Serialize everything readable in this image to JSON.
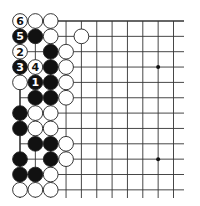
{
  "diagram": {
    "type": "go-board-fragment",
    "grid": {
      "origin_x": 20,
      "origin_y": 21,
      "spacing": 15.35,
      "columns": 11,
      "rows": 12,
      "line_extend_right": 184,
      "line_extend_bottom": 198,
      "line_color": "#333333",
      "top_edge": true,
      "left_edge": true
    },
    "star_points": [
      {
        "col": 9,
        "row": 3
      },
      {
        "col": 9,
        "row": 9
      }
    ],
    "stones": [
      {
        "col": 0,
        "row": 0,
        "color": "white",
        "label": "6"
      },
      {
        "col": 1,
        "row": 0,
        "color": "white"
      },
      {
        "col": 2,
        "row": 0,
        "color": "white"
      },
      {
        "col": 0,
        "row": 1,
        "color": "black",
        "label": "5"
      },
      {
        "col": 1,
        "row": 1,
        "color": "black"
      },
      {
        "col": 2,
        "row": 1,
        "color": "white"
      },
      {
        "col": 4,
        "row": 1,
        "color": "white"
      },
      {
        "col": 0,
        "row": 2,
        "color": "white",
        "label": "2"
      },
      {
        "col": 2,
        "row": 2,
        "color": "black"
      },
      {
        "col": 3,
        "row": 2,
        "color": "white"
      },
      {
        "col": 0,
        "row": 3,
        "color": "black",
        "label": "3"
      },
      {
        "col": 1,
        "row": 3,
        "color": "white",
        "label": "4"
      },
      {
        "col": 2,
        "row": 3,
        "color": "black"
      },
      {
        "col": 3,
        "row": 3,
        "color": "white"
      },
      {
        "col": 0,
        "row": 4,
        "color": "white"
      },
      {
        "col": 1,
        "row": 4,
        "color": "black",
        "label": "1"
      },
      {
        "col": 2,
        "row": 4,
        "color": "black"
      },
      {
        "col": 3,
        "row": 4,
        "color": "white"
      },
      {
        "col": 1,
        "row": 5,
        "color": "black"
      },
      {
        "col": 2,
        "row": 5,
        "color": "black"
      },
      {
        "col": 3,
        "row": 5,
        "color": "white"
      },
      {
        "col": 0,
        "row": 6,
        "color": "black"
      },
      {
        "col": 1,
        "row": 6,
        "color": "white"
      },
      {
        "col": 2,
        "row": 6,
        "color": "white"
      },
      {
        "col": 0,
        "row": 7,
        "color": "black"
      },
      {
        "col": 1,
        "row": 7,
        "color": "white"
      },
      {
        "col": 2,
        "row": 7,
        "color": "white"
      },
      {
        "col": 1,
        "row": 8,
        "color": "black"
      },
      {
        "col": 2,
        "row": 8,
        "color": "black"
      },
      {
        "col": 3,
        "row": 8,
        "color": "white"
      },
      {
        "col": 0,
        "row": 9,
        "color": "black"
      },
      {
        "col": 2,
        "row": 9,
        "color": "black"
      },
      {
        "col": 3,
        "row": 9,
        "color": "white"
      },
      {
        "col": 0,
        "row": 10,
        "color": "black"
      },
      {
        "col": 1,
        "row": 10,
        "color": "black"
      },
      {
        "col": 2,
        "row": 10,
        "color": "white"
      },
      {
        "col": 0,
        "row": 11,
        "color": "white"
      },
      {
        "col": 1,
        "row": 11,
        "color": "white"
      },
      {
        "col": 2,
        "row": 11,
        "color": "white"
      }
    ],
    "colors": {
      "black_stone": "#111111",
      "white_stone": "#ffffff",
      "stone_outline": "#222222",
      "background": "#ffffff"
    }
  }
}
